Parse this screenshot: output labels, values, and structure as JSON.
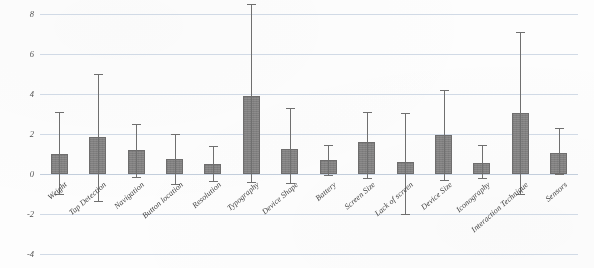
{
  "chart_data": {
    "type": "bar",
    "title": "",
    "subtitle": "",
    "xlabel": "",
    "ylabel": "",
    "ylim": [
      -4,
      8
    ],
    "yticks": [
      8,
      6,
      4,
      2,
      0,
      -2,
      -4
    ],
    "ytick_labels": [
      "8",
      "6",
      "4",
      "2",
      "0",
      "-2",
      "-4"
    ],
    "grid": true,
    "legend": "none",
    "error_bars": true,
    "bar_color": "#807f7f",
    "gridline_color": "#c9d4e2",
    "categories": [
      "Weight",
      "Tap Detection",
      "Navigation",
      "Button location",
      "Resolution",
      "Typography",
      "Device Shape",
      "Battery",
      "Screen Size",
      "Lack of screen",
      "Device Size",
      "Iconography",
      "Interaction Technique",
      "Sensors"
    ],
    "values": [
      1.0,
      1.85,
      1.2,
      0.75,
      0.5,
      3.9,
      1.25,
      0.7,
      1.6,
      0.6,
      1.95,
      0.55,
      3.05,
      1.05
    ],
    "err_upper": [
      3.1,
      5.0,
      2.5,
      2.0,
      1.4,
      8.5,
      3.3,
      1.45,
      3.1,
      3.05,
      4.2,
      1.45,
      7.1,
      2.3
    ],
    "err_lower": [
      -1.0,
      -1.35,
      -0.15,
      -0.5,
      -0.35,
      -0.4,
      -0.45,
      -0.05,
      -0.2,
      -2.0,
      -0.3,
      -0.2,
      -1.0,
      0.0
    ]
  }
}
